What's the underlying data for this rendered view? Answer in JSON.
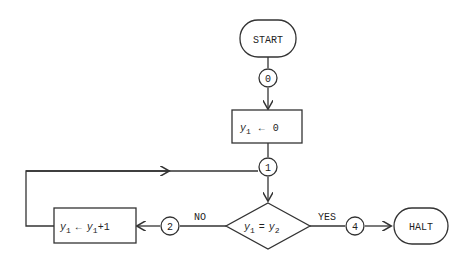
{
  "flowchart": {
    "start": {
      "label": "START"
    },
    "halt": {
      "label": "HALT"
    },
    "connectors": {
      "c0": "0",
      "c1": "1",
      "c2": "2",
      "c4": "4"
    },
    "assign_init": {
      "var": "y",
      "sub": "1",
      "op": "←",
      "value": "0"
    },
    "increment": {
      "var": "y",
      "sub": "1",
      "op": "←",
      "rhs_var": "y",
      "rhs_sub": "1",
      "rhs_tail": "+1"
    },
    "decision": {
      "lhs_var": "y",
      "lhs_sub": "1",
      "eq": "=",
      "rhs_var": "y",
      "rhs_sub": "2"
    },
    "edges": {
      "no_label": "NO",
      "yes_label": "YES"
    }
  }
}
